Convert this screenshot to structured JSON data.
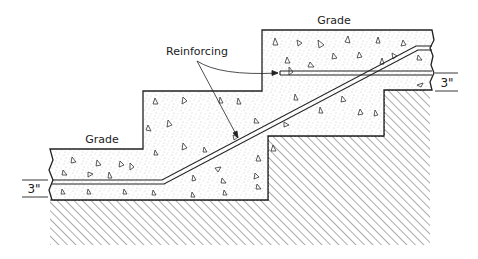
{
  "diagram": {
    "type": "cross-section",
    "labels": {
      "grade_upper": "Grade",
      "grade_lower": "Grade",
      "reinforcing": "Reinforcing",
      "dim_right": "3\"",
      "dim_left": "3\""
    },
    "colors": {
      "line": "#222222",
      "hatch": "#555555",
      "stipple": "#888888",
      "background": "#ffffff"
    }
  }
}
